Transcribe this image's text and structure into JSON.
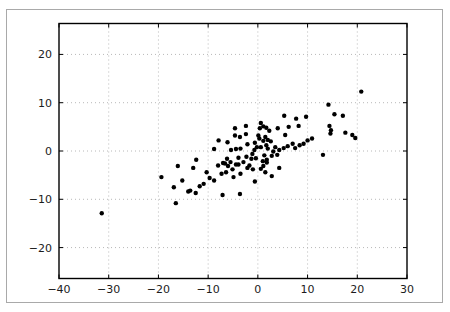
{
  "figure": {
    "width_px": 450,
    "height_px": 312,
    "background_color": "#ffffff",
    "frame_border_color": "#a9a9a9"
  },
  "chart_data": {
    "type": "scatter",
    "title": "",
    "xlabel": "",
    "ylabel": "",
    "xlim": [
      -40,
      30
    ],
    "ylim": [
      -26.4,
      26.4
    ],
    "x_ticks": [
      -40,
      -30,
      -20,
      -10,
      0,
      10,
      20,
      30
    ],
    "x_tick_labels": [
      "−40",
      "−30",
      "−20",
      "−10",
      "0",
      "10",
      "20",
      "30"
    ],
    "y_ticks": [
      -20,
      -10,
      0,
      10,
      20
    ],
    "y_tick_labels": [
      "−20",
      "−10",
      "0",
      "10",
      "20"
    ],
    "grid": {
      "visible": true,
      "line_style": "dotted",
      "color": "#b8b8b8"
    },
    "spine_color": "#000000",
    "tick_label_color": "#1c1c1c",
    "tick_length_px": 4,
    "tick_label_font_size_px": 11,
    "legend": null,
    "marker": {
      "shape": "circle",
      "color": "#000000",
      "diameter_px": 4.4
    },
    "points": [
      [
        -19.4,
        -5.4
      ],
      [
        -16.9,
        -7.5
      ],
      [
        -16.5,
        -10.8
      ],
      [
        -16.1,
        -3.1
      ],
      [
        -15.2,
        -6.1
      ],
      [
        -14.0,
        -8.4
      ],
      [
        -13.6,
        -8.2
      ],
      [
        -13.0,
        -3.5
      ],
      [
        -12.5,
        -8.7
      ],
      [
        -11.7,
        -7.3
      ],
      [
        -10.9,
        -6.8
      ],
      [
        -10.3,
        -4.4
      ],
      [
        -9.7,
        -5.6
      ],
      [
        -8.8,
        -6.1
      ],
      [
        -8.0,
        -3.0
      ],
      [
        -7.3,
        -4.7
      ],
      [
        -7.1,
        -9.1
      ],
      [
        -6.6,
        -2.6
      ],
      [
        -6.4,
        -4.4
      ],
      [
        -6.0,
        -3.1
      ],
      [
        -5.1,
        -3.8
      ],
      [
        -4.9,
        -5.4
      ],
      [
        -4.4,
        -2.8
      ],
      [
        -3.9,
        -2.8
      ],
      [
        -3.6,
        -8.9
      ],
      [
        -3.5,
        -4.7
      ],
      [
        -2.1,
        -3.5
      ],
      [
        -1.7,
        -3.0
      ],
      [
        -1.0,
        -3.8
      ],
      [
        -0.6,
        -6.3
      ],
      [
        0.6,
        -3.7
      ],
      [
        1.1,
        -3.1
      ],
      [
        1.5,
        -4.4
      ],
      [
        -12.4,
        -1.8
      ],
      [
        -8.8,
        0.4
      ],
      [
        -7.9,
        2.2
      ],
      [
        -7.0,
        -2.5
      ],
      [
        -6.2,
        -1.6
      ],
      [
        -5.5,
        -2.3
      ],
      [
        -4.6,
        3.2
      ],
      [
        -4.4,
        0.4
      ],
      [
        -3.6,
        2.9
      ],
      [
        -3.5,
        0.5
      ],
      [
        -3.9,
        -1.4
      ],
      [
        -2.9,
        -2.3
      ],
      [
        -2.4,
        5.2
      ],
      [
        -2.1,
        1.4
      ],
      [
        -1.3,
        -1.6
      ],
      [
        -1.1,
        -0.6
      ],
      [
        -0.6,
        1.7
      ],
      [
        -0.2,
        0.8
      ],
      [
        0.6,
        5.8
      ],
      [
        0.4,
        4.7
      ],
      [
        0.3,
        2.6
      ],
      [
        0.6,
        0.8
      ],
      [
        1.1,
        2.1
      ],
      [
        1.5,
        2.9
      ],
      [
        1.8,
        -1.8
      ],
      [
        1.0,
        -2.1
      ],
      [
        2.0,
        2.3
      ],
      [
        2.0,
        0.5
      ],
      [
        -4.6,
        4.7
      ],
      [
        1.1,
        5.1
      ],
      [
        2.3,
        4.2
      ],
      [
        4.0,
        4.7
      ],
      [
        -2.4,
        3.5
      ],
      [
        0.1,
        3.2
      ],
      [
        -6.1,
        1.8
      ],
      [
        -5.4,
        0.2
      ],
      [
        -0.7,
        0.2
      ],
      [
        -2.3,
        -1.2
      ],
      [
        -0.4,
        -1.5
      ],
      [
        5.3,
        7.3
      ],
      [
        7.7,
        6.7
      ],
      [
        9.7,
        7.1
      ],
      [
        15.4,
        7.6
      ],
      [
        17.1,
        7.3
      ],
      [
        1.7,
        4.8
      ],
      [
        2.6,
        2.0
      ],
      [
        5.5,
        3.3
      ],
      [
        6.2,
        5.0
      ],
      [
        8.2,
        5.2
      ],
      [
        14.4,
        5.2
      ],
      [
        14.7,
        4.3
      ],
      [
        14.6,
        3.6
      ],
      [
        17.6,
        3.8
      ],
      [
        19.0,
        3.3
      ],
      [
        19.6,
        2.7
      ],
      [
        1.7,
        1.2
      ],
      [
        3.5,
        0.8
      ],
      [
        3.1,
        -0.1
      ],
      [
        4.3,
        0.2
      ],
      [
        5.2,
        0.6
      ],
      [
        6.0,
        1.0
      ],
      [
        7.0,
        1.5
      ],
      [
        7.5,
        0.6
      ],
      [
        8.4,
        1.2
      ],
      [
        9.2,
        1.5
      ],
      [
        10.0,
        2.2
      ],
      [
        10.9,
        2.6
      ],
      [
        1.3,
        -0.9
      ],
      [
        2.8,
        -1.0
      ],
      [
        3.9,
        -0.8
      ],
      [
        13.1,
        -0.8
      ],
      [
        1.8,
        -2.4
      ],
      [
        4.3,
        -3.5
      ],
      [
        2.8,
        -5.2
      ],
      [
        14.2,
        9.6
      ],
      [
        20.8,
        12.3
      ],
      [
        -31.4,
        -12.9
      ]
    ]
  }
}
